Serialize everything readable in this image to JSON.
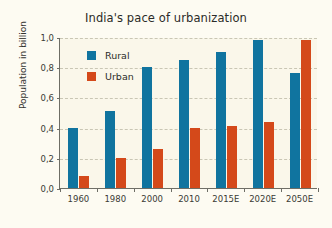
{
  "chart_data": {
    "type": "bar",
    "title": "India's pace of urbanization",
    "xlabel": "",
    "ylabel": "Population in billion",
    "categories": [
      "1960",
      "1980",
      "2000",
      "2010",
      "2015E",
      "2020E",
      "2050E"
    ],
    "series": [
      {
        "name": "Rural",
        "color": "#10749f",
        "values": [
          0.4,
          0.51,
          0.8,
          0.85,
          0.9,
          0.98,
          0.76
        ]
      },
      {
        "name": "Urban",
        "color": "#d4491a",
        "values": [
          0.08,
          0.2,
          0.26,
          0.4,
          0.41,
          0.44,
          0.98
        ]
      }
    ],
    "ylim": [
      0.0,
      1.0
    ],
    "yticks": [
      "0,0",
      "0,2",
      "0,4",
      "0,6",
      "0,8",
      "1,0"
    ],
    "ytick_values": [
      0.0,
      0.2,
      0.4,
      0.6,
      0.8,
      1.0
    ],
    "grid": true,
    "legend_position": "upper left inside",
    "decimal_separator": ",",
    "background_color": "#faf7ea",
    "axis_color": "#6e6e66",
    "gridline_color": "#c9c6b4"
  }
}
